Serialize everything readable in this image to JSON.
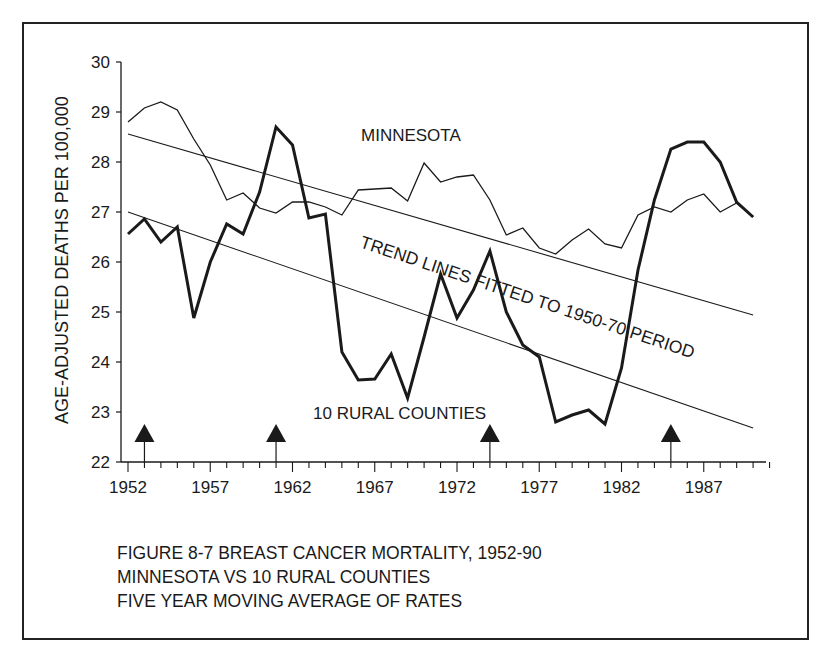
{
  "chart_data": {
    "type": "line",
    "title": "FIGURE 8-7  BREAST CANCER MORTALITY, 1952-90",
    "subtitle_lines": [
      "MINNESOTA VS 10 RURAL COUNTIES",
      "FIVE YEAR MOVING AVERAGE OF RATES"
    ],
    "xlabel": "",
    "ylabel": "AGE-ADJUSTED DEATHS PER 100,000",
    "xlim": [
      1952,
      1991
    ],
    "ylim": [
      22,
      30
    ],
    "grid": false,
    "legend": "none (inline labels)",
    "x_ticks": [
      1952,
      1957,
      1962,
      1967,
      1972,
      1977,
      1982,
      1987
    ],
    "y_ticks": [
      22,
      23,
      24,
      25,
      26,
      27,
      28,
      29,
      30
    ],
    "x": [
      1952,
      1953,
      1954,
      1955,
      1956,
      1957,
      1958,
      1959,
      1960,
      1961,
      1962,
      1963,
      1964,
      1965,
      1966,
      1967,
      1968,
      1969,
      1970,
      1971,
      1972,
      1973,
      1974,
      1975,
      1976,
      1977,
      1978,
      1979,
      1980,
      1981,
      1982,
      1983,
      1984,
      1985,
      1986,
      1987,
      1988,
      1989,
      1990
    ],
    "series": [
      {
        "name": "MINNESOTA",
        "style": "thin",
        "values": [
          28.8,
          29.08,
          29.2,
          29.04,
          28.46,
          27.94,
          27.24,
          27.38,
          27.08,
          26.98,
          27.2,
          27.2,
          27.1,
          26.94,
          27.44,
          27.46,
          27.48,
          27.22,
          27.98,
          27.6,
          27.7,
          27.74,
          27.24,
          26.54,
          26.68,
          26.28,
          26.16,
          26.44,
          26.66,
          26.36,
          26.28,
          26.94,
          27.1,
          27.0,
          27.24,
          27.36,
          27.0,
          27.18,
          26.9
        ]
      },
      {
        "name": "10 RURAL COUNTIES",
        "style": "thick",
        "values": [
          26.56,
          26.86,
          26.4,
          26.7,
          24.88,
          26.0,
          26.76,
          26.56,
          27.4,
          28.7,
          28.34,
          26.88,
          26.96,
          24.2,
          23.64,
          23.66,
          24.16,
          23.28,
          24.5,
          25.76,
          24.88,
          25.44,
          26.22,
          25.0,
          24.34,
          24.1,
          22.8,
          22.94,
          23.04,
          22.76,
          23.88,
          25.84,
          27.24,
          28.26,
          28.4,
          28.4,
          28.0,
          27.2,
          26.9
        ]
      },
      {
        "name": "Minnesota trend line (fitted 1950-70)",
        "style": "trend",
        "x": [
          1952,
          1990
        ],
        "values": [
          28.56,
          24.94
        ]
      },
      {
        "name": "Rural counties trend line (fitted 1950-70)",
        "style": "trend",
        "x": [
          1952,
          1990
        ],
        "values": [
          27.0,
          22.68
        ]
      }
    ],
    "annotations": [
      {
        "text": "MINNESOTA",
        "x": 1966,
        "y": 28.6
      },
      {
        "text": "10 RURAL COUNTIES",
        "x": 1963,
        "y": 23.0
      },
      {
        "text": "TREND LINES FITTED TO 1950-70 PERIOD",
        "x": 1966,
        "y": 26.3,
        "rotation_deg": 18.5
      }
    ],
    "event_arrows": [
      1953,
      1961,
      1974,
      1985
    ]
  },
  "caption": {
    "line1": "FIGURE 8-7  BREAST CANCER MORTALITY, 1952-90",
    "line2": "MINNESOTA VS 10 RURAL COUNTIES",
    "line3": "FIVE YEAR MOVING AVERAGE OF RATES"
  },
  "labels": {
    "ylabel": "AGE-ADJUSTED DEATHS PER 100,000",
    "minnesota": "MINNESOTA",
    "rural": "10 RURAL COUNTIES",
    "trend": "TREND LINES FITTED TO 1950-70 PERIOD"
  },
  "colors": {
    "ink": "#1a1a1a",
    "background": "#ffffff"
  }
}
